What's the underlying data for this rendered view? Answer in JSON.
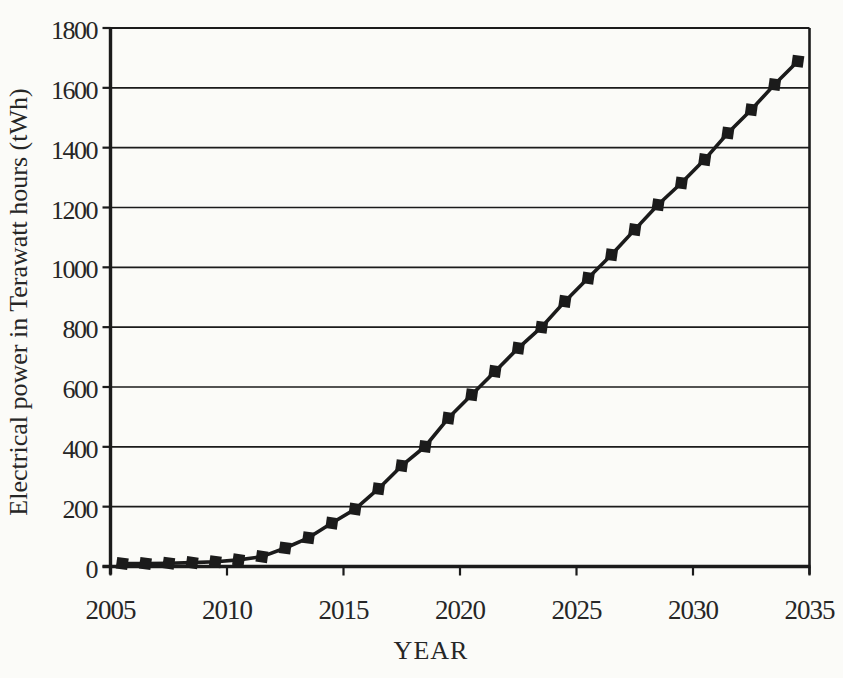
{
  "page": {
    "background": "#fbfbf8",
    "ink": "#1b1b1b",
    "text_color": "#262626"
  },
  "chart_data": {
    "type": "line",
    "title": "",
    "xlabel": "YEAR",
    "ylabel": "Electrical power in Terawatt hours (tWh)",
    "x": [
      2005,
      2006,
      2007,
      2008,
      2009,
      2010,
      2011,
      2012,
      2013,
      2014,
      2015,
      2016,
      2017,
      2018,
      2019,
      2020,
      2021,
      2022,
      2023,
      2024,
      2025,
      2026,
      2027,
      2028,
      2029,
      2030,
      2031,
      2032,
      2033,
      2034
    ],
    "series": [
      {
        "name": "Electrical power (tWh)",
        "values": [
          10,
          10,
          11,
          13,
          16,
          22,
          33,
          62,
          96,
          145,
          192,
          260,
          337,
          401,
          496,
          574,
          652,
          730,
          800,
          886,
          964,
          1042,
          1126,
          1209,
          1282,
          1360,
          1449,
          1527,
          1611,
          1689
        ]
      }
    ],
    "xlim": [
      2005,
      2035
    ],
    "ylim": [
      0,
      1800
    ],
    "xticks": [
      2005,
      2010,
      2015,
      2020,
      2025,
      2030,
      2035
    ],
    "yticks": [
      0,
      200,
      400,
      600,
      800,
      1000,
      1200,
      1400,
      1600,
      1800
    ],
    "grid": "horizontal",
    "legend": "none",
    "marker": "filled-square",
    "line_color": "#1b1b1b",
    "marker_color": "#1b1b1b",
    "point_x_offset_years": 0.5
  }
}
